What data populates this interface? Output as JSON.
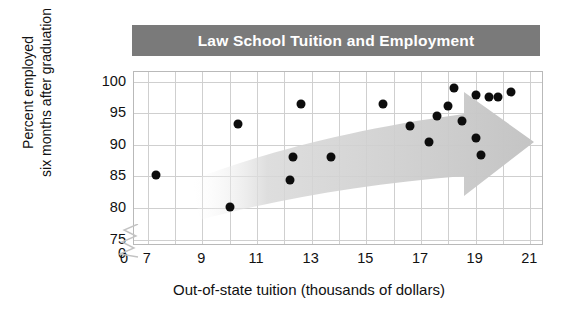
{
  "chart_data": {
    "type": "scatter",
    "title": "Law School Tuition and Employment",
    "xlabel": "Out-of-state tuition (thousands of dollars)",
    "ylabel_line1": "Percent employed",
    "ylabel_line2": "six months after graduation",
    "xlim": [
      6.5,
      21.5
    ],
    "ylim": [
      74,
      101.5
    ],
    "xticks": [
      "0",
      "7",
      "9",
      "11",
      "13",
      "15",
      "17",
      "19",
      "21"
    ],
    "yticks": [
      "0",
      "75",
      "80",
      "85",
      "90",
      "95",
      "100"
    ],
    "x_axis_break": true,
    "y_axis_break": true,
    "grid": true,
    "legend": "none",
    "annotation": "shaded arrow showing increasing trend from lower-left to upper-right",
    "points": [
      {
        "x": 7.3,
        "y": 85.2
      },
      {
        "x": 10.0,
        "y": 80.2
      },
      {
        "x": 10.3,
        "y": 93.3
      },
      {
        "x": 12.2,
        "y": 84.5
      },
      {
        "x": 12.3,
        "y": 88.1
      },
      {
        "x": 12.6,
        "y": 96.4
      },
      {
        "x": 13.7,
        "y": 88.1
      },
      {
        "x": 15.6,
        "y": 96.4
      },
      {
        "x": 16.6,
        "y": 92.9
      },
      {
        "x": 17.3,
        "y": 90.4
      },
      {
        "x": 17.6,
        "y": 94.6
      },
      {
        "x": 18.0,
        "y": 96.2
      },
      {
        "x": 18.2,
        "y": 99.0
      },
      {
        "x": 18.5,
        "y": 93.8
      },
      {
        "x": 19.0,
        "y": 97.9
      },
      {
        "x": 19.0,
        "y": 91.0
      },
      {
        "x": 19.2,
        "y": 88.4
      },
      {
        "x": 19.5,
        "y": 97.6
      },
      {
        "x": 19.8,
        "y": 97.6
      },
      {
        "x": 20.3,
        "y": 98.3
      }
    ],
    "colors": {
      "banner": "#7a7a7a",
      "banner_text": "#ffffff",
      "point": "#0d0d0d",
      "arrow": "#c9c9c9",
      "grid": "#cfcfcf",
      "frame": "#b9b9b9"
    }
  }
}
